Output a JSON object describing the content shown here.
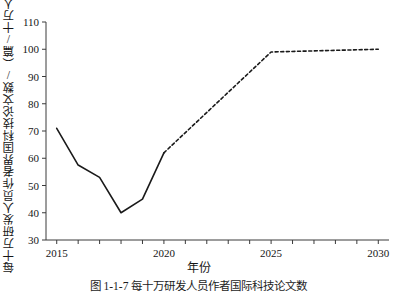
{
  "figure": {
    "caption": "图 1-1-7 每十万研发人员作者国际科技论文数",
    "axis_x_label": "年份",
    "axis_y_label": "每十万研发人员作者界国科技论文数/（篇/十万人）"
  },
  "chart_data": {
    "type": "line",
    "title": "",
    "xlabel": "年份",
    "ylabel": "每十万研发人员作者界国科技论文数/（篇/十万人）",
    "xlim": [
      2014.5,
      2030.5
    ],
    "ylim": [
      30,
      110
    ],
    "xticks": [
      2015,
      2016,
      2017,
      2018,
      2019,
      2020,
      2021,
      2022,
      2023,
      2024,
      2025,
      2026,
      2027,
      2028,
      2029,
      2030
    ],
    "xtick_labels_shown": [
      "2015",
      "2020",
      "2025",
      "2030"
    ],
    "yticks": [
      30,
      40,
      50,
      60,
      70,
      80,
      90,
      100,
      110
    ],
    "ytick_labels": [
      "30",
      "40",
      "50",
      "60",
      "70",
      "80",
      "90",
      "100",
      "110"
    ],
    "grid": false,
    "legend": null,
    "series": [
      {
        "name": "实际值",
        "style": "solid",
        "color": "#1a1a1a",
        "x": [
          2015,
          2016,
          2017,
          2018,
          2019,
          2020
        ],
        "values": [
          71,
          57.5,
          53,
          40,
          45,
          62
        ]
      },
      {
        "name": "预测值",
        "style": "dashed",
        "color": "#1a1a1a",
        "x": [
          2020,
          2025,
          2030
        ],
        "values": [
          62,
          99,
          100
        ]
      }
    ]
  }
}
